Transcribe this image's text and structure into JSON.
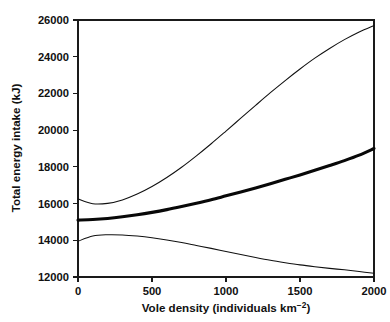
{
  "chart_data": {
    "type": "line",
    "title": "",
    "xlabel": "Vole density (individuals km⁻²)",
    "ylabel": "Total energy intake (kJ)",
    "xlim": [
      0,
      2000
    ],
    "ylim": [
      12000,
      26000
    ],
    "xticks": [
      0,
      500,
      1000,
      1500,
      2000
    ],
    "yticks": [
      12000,
      14000,
      16000,
      18000,
      20000,
      22000,
      24000,
      26000
    ],
    "xtick_labels": [
      "0",
      "500",
      "1000",
      "1500",
      "2000"
    ],
    "ytick_labels": [
      "12000",
      "14000",
      "16000",
      "18000",
      "20000",
      "22000",
      "24000",
      "26000"
    ],
    "grid": false,
    "legend": null,
    "legend_position": "none",
    "frame": "box",
    "x": [
      0,
      100,
      200,
      300,
      400,
      500,
      600,
      700,
      800,
      900,
      1000,
      1100,
      1200,
      1300,
      1400,
      1500,
      1600,
      1700,
      1800,
      1900,
      2000
    ],
    "series": [
      {
        "name": "upper-confidence-curve",
        "style": "thin",
        "linewidth": 1,
        "values": [
          16250,
          15990,
          16010,
          16200,
          16520,
          16930,
          17420,
          17980,
          18600,
          19260,
          19950,
          20650,
          21350,
          22040,
          22700,
          23330,
          23920,
          24450,
          24930,
          25350,
          25700
        ]
      },
      {
        "name": "mean-energy-intake-curve",
        "style": "thick",
        "linewidth": 3,
        "values": [
          15100,
          15130,
          15190,
          15280,
          15390,
          15520,
          15670,
          15840,
          16020,
          16210,
          16420,
          16630,
          16850,
          17080,
          17320,
          17560,
          17810,
          18070,
          18340,
          18640,
          19000
        ]
      },
      {
        "name": "lower-confidence-curve",
        "style": "thin",
        "linewidth": 1,
        "values": [
          13950,
          14230,
          14300,
          14290,
          14230,
          14140,
          14020,
          13880,
          13720,
          13560,
          13390,
          13220,
          13060,
          12910,
          12780,
          12660,
          12560,
          12470,
          12390,
          12300,
          12200
        ]
      }
    ]
  },
  "axes": {
    "ylabel_text": "Total energy intake (kJ)",
    "xlabel_main": "Vole density (individuals km",
    "xlabel_sup": "−2",
    "xlabel_close": ")"
  },
  "colors": {
    "line": "#101010",
    "axis": "#1a1a1a",
    "background": "#ffffff"
  }
}
